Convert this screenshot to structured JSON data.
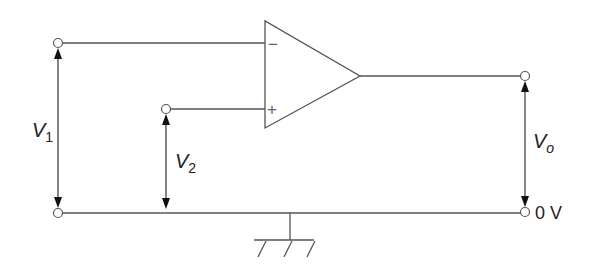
{
  "diagram": {
    "type": "op-amp differential amplifier circuit",
    "labels": {
      "v1": {
        "main": "V",
        "sub": "1"
      },
      "v2": {
        "main": "V",
        "sub": "2"
      },
      "vo": {
        "main": "V",
        "sub": "o"
      },
      "ground_terminal": "0 V"
    },
    "opamp": {
      "inverting_input": "−",
      "non_inverting_input": "+"
    },
    "colors": {
      "wire": "#555555",
      "arrow": "#111111",
      "text": "#222222",
      "background": "#ffffff"
    }
  }
}
